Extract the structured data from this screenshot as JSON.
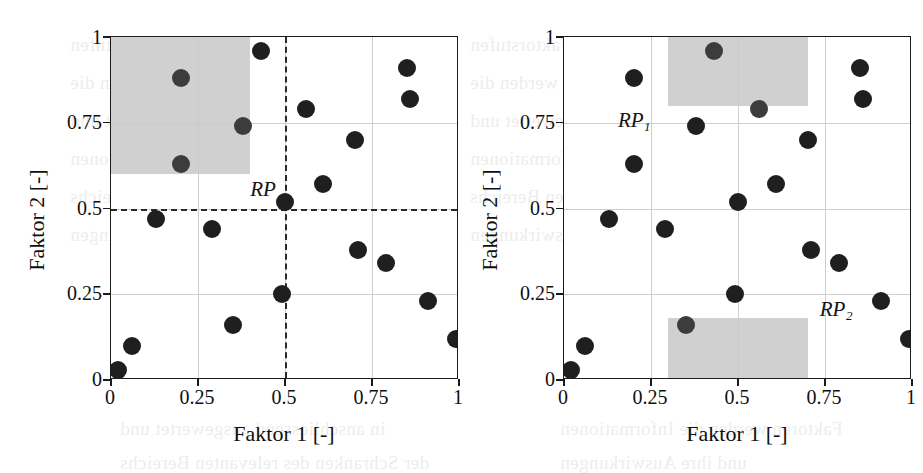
{
  "figure": {
    "type": "two-panel-scatter",
    "background": "#ffffff",
    "marker_color": "#1f1f1f",
    "region_color": "#c9c9c9",
    "guide_color": "#2a2a2a"
  },
  "bleed_text": {
    "lines": [
      "der Versuchsplanung sind die Faktorstufen",
      "dem Simulationsmodell werden die",
      "in anschliessend ausgewertet und",
      "Faktoren werden die Informationen",
      "der Schranken des relevanten Bereichs",
      "und ihre Auswirkungen"
    ]
  },
  "axes": {
    "xlabel": "Faktor 1 [-]",
    "ylabel": "Faktor 2 [-]",
    "xticks": [
      "0",
      "0.25",
      "0.5",
      "0.75",
      "1"
    ],
    "yticks": [
      "0",
      "0.25",
      "0.5",
      "0.75",
      "1"
    ],
    "xlim": [
      0,
      1
    ],
    "ylim": [
      0,
      1
    ],
    "grid": true
  },
  "chart_data": [
    {
      "type": "scatter",
      "panel": "left",
      "title": "",
      "xlabel": "Faktor 1 [-]",
      "ylabel": "Faktor 2 [-]",
      "xlim": [
        0,
        1
      ],
      "ylim": [
        0,
        1
      ],
      "xticks": [
        0,
        0.25,
        0.5,
        0.75,
        1
      ],
      "yticks": [
        0,
        0.25,
        0.5,
        0.75,
        1
      ],
      "grid": true,
      "legend": "none",
      "series": [
        {
          "name": "Versuchspunkte",
          "x": [
            0.02,
            0.06,
            0.13,
            0.2,
            0.2,
            0.29,
            0.35,
            0.38,
            0.43,
            0.49,
            0.5,
            0.56,
            0.61,
            0.7,
            0.71,
            0.79,
            0.85,
            0.86,
            0.91,
            0.99
          ],
          "y": [
            0.03,
            0.1,
            0.47,
            0.88,
            0.63,
            0.44,
            0.16,
            0.74,
            0.96,
            0.25,
            0.52,
            0.79,
            0.57,
            0.7,
            0.38,
            0.34,
            0.91,
            0.82,
            0.23,
            0.12
          ]
        }
      ],
      "guides": [
        {
          "orientation": "vertical",
          "value": 0.5,
          "style": "dashed"
        },
        {
          "orientation": "horizontal",
          "value": 0.5,
          "style": "dashed"
        }
      ],
      "regions": [
        {
          "label": "RP",
          "x0": 0.0,
          "x1": 0.4,
          "y0": 0.6,
          "y1": 1.0,
          "fill": "#c9c9c9"
        }
      ],
      "annotations": [
        {
          "text": "RP",
          "x": 0.4,
          "y": 0.555
        }
      ]
    },
    {
      "type": "scatter",
      "panel": "right",
      "title": "",
      "xlabel": "Faktor 1 [-]",
      "ylabel": "Faktor 2 [-]",
      "xlim": [
        0,
        1
      ],
      "ylim": [
        0,
        1
      ],
      "xticks": [
        0,
        0.25,
        0.5,
        0.75,
        1
      ],
      "yticks": [
        0,
        0.25,
        0.5,
        0.75,
        1
      ],
      "grid": true,
      "legend": "none",
      "series": [
        {
          "name": "Versuchspunkte",
          "x": [
            0.02,
            0.06,
            0.13,
            0.2,
            0.2,
            0.29,
            0.35,
            0.38,
            0.43,
            0.49,
            0.5,
            0.56,
            0.61,
            0.7,
            0.71,
            0.79,
            0.85,
            0.86,
            0.91,
            0.99
          ],
          "y": [
            0.03,
            0.1,
            0.47,
            0.88,
            0.63,
            0.44,
            0.16,
            0.74,
            0.96,
            0.25,
            0.52,
            0.79,
            0.57,
            0.7,
            0.38,
            0.34,
            0.91,
            0.82,
            0.23,
            0.12
          ]
        }
      ],
      "guides": [],
      "regions": [
        {
          "label": "RP1",
          "x0": 0.3,
          "x1": 0.7,
          "y0": 0.8,
          "y1": 1.0,
          "fill": "#c9c9c9"
        },
        {
          "label": "RP2",
          "x0": 0.3,
          "x1": 0.7,
          "y0": 0.0,
          "y1": 0.18,
          "fill": "#c9c9c9"
        }
      ],
      "annotations": [
        {
          "text": "RP",
          "sub": "1",
          "x": 0.155,
          "y": 0.755
        },
        {
          "text": "RP",
          "sub": "2",
          "x": 0.735,
          "y": 0.205
        }
      ]
    }
  ]
}
